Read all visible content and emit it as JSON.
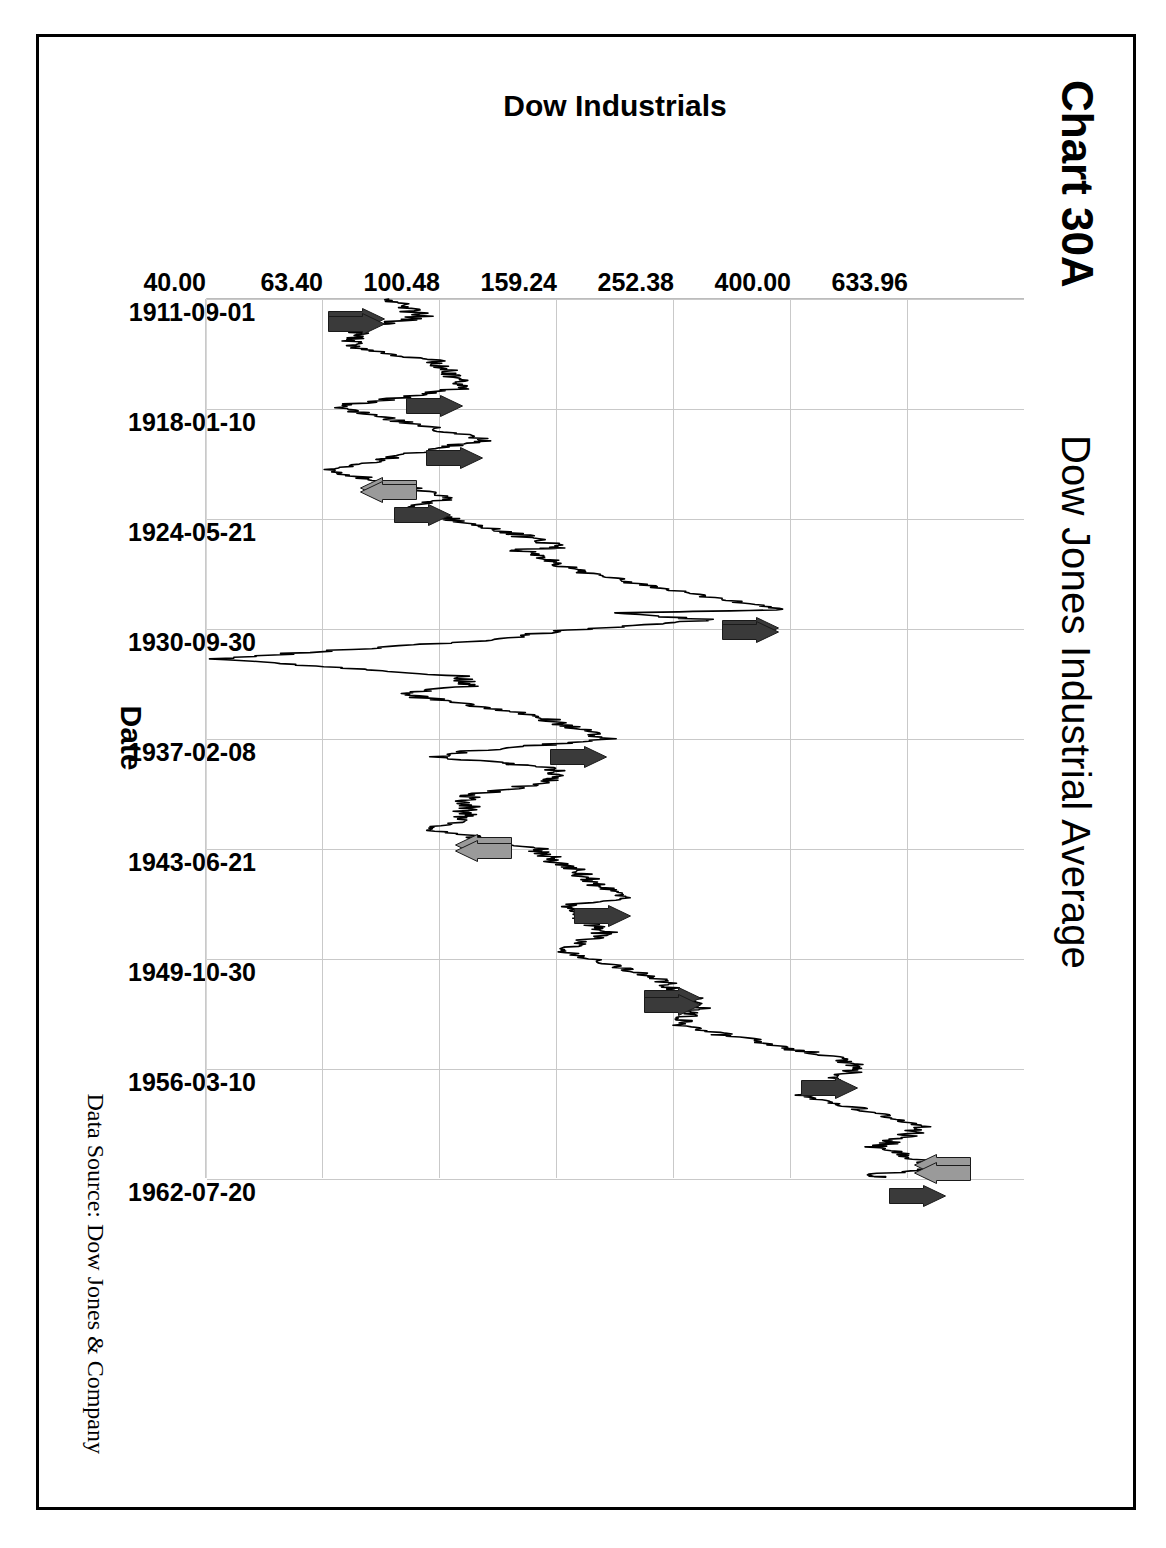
{
  "figure": {
    "chart_number": "Chart 30A",
    "title": "Dow Jones Industrial Average",
    "data_source": "Data Source:  Dow Jones & Company",
    "frame_color": "#000000",
    "gridline_color": "#c9c9c9",
    "line_color": "#000000",
    "peak_arrow_color": "#3a3a3a",
    "trough_arrow_color": "#9a9a9a"
  },
  "chart_data": {
    "type": "line",
    "title": "Dow Jones Industrial Average",
    "xlabel": "Date",
    "ylabel": "Dow Industrials",
    "y_scale": "log",
    "grid": true,
    "legend": "none",
    "rotation_degrees": 90,
    "ylim": [
      40.0,
      1000.0
    ],
    "ytick_labels": [
      "633.96",
      "400.00",
      "252.38",
      "159.24",
      "100.48",
      "63.40",
      "40.00"
    ],
    "ytick_values": [
      633.96,
      400.0,
      252.38,
      159.24,
      100.48,
      63.4,
      40.0
    ],
    "xtick_labels": [
      "1911-09-01",
      "1918-01-10",
      "1924-05-21",
      "1930-09-30",
      "1937-02-08",
      "1943-06-21",
      "1949-10-30",
      "1956-03-10",
      "1962-07-20"
    ],
    "xlim": [
      "1911-09-01",
      "1962-07-20"
    ],
    "series": [
      {
        "name": "Dow Industrials",
        "x": [
          "1911-09",
          "1912-09",
          "1913-06",
          "1914-07",
          "1915-04",
          "1916-11",
          "1917-12",
          "1919-11",
          "1921-08",
          "1923-03",
          "1923-10",
          "1925-06",
          "1926-02",
          "1926-03",
          "1927-06",
          "1929-09",
          "1929-11",
          "1930-04",
          "1930-12",
          "1931-06",
          "1932-07",
          "1933-07",
          "1934-02",
          "1934-07",
          "1935-11",
          "1937-03",
          "1937-11",
          "1938-03",
          "1938-11",
          "1939-09",
          "1940-06",
          "1941-12",
          "1942-04",
          "1943-07",
          "1945-12",
          "1946-05",
          "1946-10",
          "1948-06",
          "1949-06",
          "1950-12",
          "1952-08",
          "1953-09",
          "1955-09",
          "1956-04",
          "1957-10",
          "1959-08",
          "1960-10",
          "1961-12",
          "1962-06",
          "1962-07"
        ],
        "values": [
          81,
          94,
          72,
          71,
          99,
          110,
          66,
          119,
          64,
          105,
          86,
          140,
          162,
          135,
          172,
          381,
          198,
          294,
          157,
          121,
          41,
          109,
          111,
          85,
          149,
          194,
          113,
          98,
          158,
          155,
          111,
          111,
          93,
          146,
          195,
          213,
          163,
          193,
          161,
          235,
          280,
          255,
          487,
          521,
          419,
          679,
          566,
          735,
          535,
          580
        ]
      }
    ],
    "annotations": {
      "peak_markers": {
        "description": "dark right-pointing arrows marking major market tops",
        "color": "#3a3a3a",
        "count": 11,
        "approx_values": [
          81,
          110,
          119,
          105,
          381,
          381,
          194,
          195,
          213,
          521,
          735
        ]
      },
      "trough_markers": {
        "description": "gray left-pointing arrows marking major market bottoms",
        "color": "#9a9a9a",
        "count": 6,
        "approx_values": [
          64,
          64,
          93,
          93,
          566,
          566
        ]
      }
    }
  }
}
